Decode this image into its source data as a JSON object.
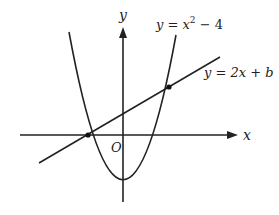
{
  "diagram": {
    "type": "function-graph",
    "axes": {
      "x_label": "x",
      "y_label": "y",
      "origin_label": "O"
    },
    "curves": [
      {
        "id": "parabola",
        "label_prefix": "y = x",
        "label_exp": "2",
        "label_suffix": " − 4",
        "equation": "y = x^2 - 4"
      },
      {
        "id": "line",
        "label": "y = 2x + b",
        "equation": "y = 2x + b"
      }
    ],
    "intersection_points": [
      {
        "x": -2,
        "y": 0
      },
      {
        "x": 1.3,
        "y": 4.6
      }
    ],
    "colors": {
      "stroke": "#222222",
      "background": "#ffffff"
    }
  }
}
